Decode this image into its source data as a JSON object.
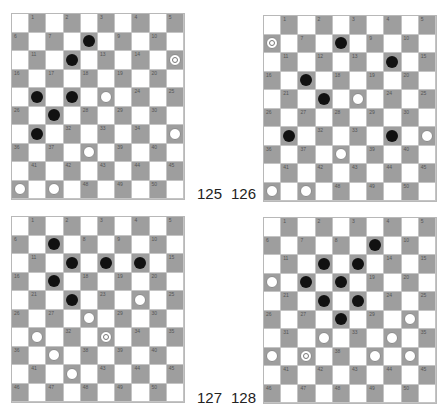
{
  "diagrams": [
    {
      "number": "125",
      "board": {
        "left": 11,
        "top": 13
      },
      "label_pos": {
        "left": 197,
        "top": 185
      },
      "pieces": {
        "8": "black",
        "12": "black",
        "15": "white-king",
        "21": "black",
        "22": "black",
        "23": "white",
        "27": "black",
        "31": "black",
        "35": "white",
        "38": "white",
        "46": "white",
        "47": "white"
      }
    },
    {
      "number": "126",
      "board": {
        "left": 263,
        "top": 15
      },
      "label_pos": {
        "left": 231,
        "top": 185
      },
      "pieces": {
        "6": "white-king",
        "8": "black",
        "14": "black",
        "17": "black",
        "22": "black",
        "23": "white",
        "31": "black",
        "34": "black",
        "35": "white",
        "38": "white",
        "46": "white",
        "47": "white"
      }
    },
    {
      "number": "127",
      "board": {
        "left": 11,
        "top": 216
      },
      "label_pos": {
        "left": 197,
        "top": 389
      },
      "pieces": {
        "7": "black",
        "12": "black",
        "13": "black",
        "14": "black",
        "17": "black",
        "22": "black",
        "24": "white",
        "28": "white",
        "31": "white",
        "33": "white-king",
        "37": "white",
        "42": "white"
      }
    },
    {
      "number": "128",
      "board": {
        "left": 263,
        "top": 217
      },
      "label_pos": {
        "left": 231,
        "top": 389
      },
      "pieces": {
        "9": "black",
        "12": "black",
        "13": "black",
        "16": "white",
        "17": "black",
        "18": "black",
        "22": "black",
        "23": "black",
        "28": "black",
        "30": "white",
        "32": "white",
        "34": "white",
        "36": "white",
        "37": "white-king",
        "39": "white",
        "40": "white"
      }
    }
  ],
  "colors": {
    "dark_square": "#9e9e9e",
    "light_square": "#ffffff",
    "black_piece": "#111111",
    "white_piece": "#ffffff"
  }
}
